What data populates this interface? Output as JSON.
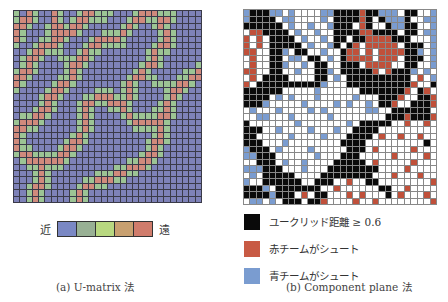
{
  "umatrix": {
    "caption": "(a) U-matrix 法",
    "scale": {
      "near_label": "近",
      "far_label": "遠",
      "colors": [
        "#7a88c4",
        "#98b094",
        "#b8d880",
        "#c8a070",
        "#d07c6c"
      ]
    },
    "cell_colors": {
      "b": "#7e82b8",
      "g": "#9cc494",
      "r": "#d08a7c",
      "y": "#b8cc8c"
    },
    "rows": [
      "gbrgbbrgbbgrrgggbbbgrrrgggbbbb",
      "grrgbbrgbgrrgggbbbgrrggrrgbbbb",
      "rrgbbgrrgrrgbbbbbgrgbbgrgbbbbb",
      "rgbbbgrrrrgbbbgggrgbbbbgrgbbbb",
      "rgbbggrrgbbbgrrrrgbbbbbgrgbbbb",
      "gbbgrrrgbbbgrrggggbbbbgrrgbbbb",
      "bbgrrgggbbgrggbbbbbbbgrggbbbbb",
      "bgrrgbbgggrrgbbbbbbbbgrgbbbbbb",
      "bgrgbbbbgrrgbbbbbbbbgrrgbbbbbg",
      "grrgbbbbgrgbbbbbbbbgrgbbbbbggr",
      "rrgbbbbggrgbbbbbbbgrrggbbbggrr",
      "rgbbbbgrrgbbbbbbbgrgbbggggrrgb",
      "gbbbbgrrgbbbbgggbgrgbbbbgrrgbb",
      "bbbbgrrgbbbggrrrggrgbbbbgrgbbb",
      "bbbbgrgbbbgrrggrrrgbbbbgrgbbbb",
      "bbbgrrgbbbgrgbbggrgbbbggrgbbbb",
      "bggrrgbbbbgrgbbbbgrggggrrgbbbb",
      "grrrgbbbbbgrgbbbbbgrrrrrgbbbbb",
      "rrggbbbbbbgrgbbbbbbggggrgbbbbb",
      "rgbbbbbbbgrgbbbbbbbbbbgrgbbbbb",
      "rgbbbbbbgrrgbbbbbbbbbgrrgbbbbb",
      "rggbbbbgrrgbbbbbbbbbbgrgbbbbbb",
      "grrggggrrgbbbbbbbbbbgrrgbbbbbb",
      "bgrrrrrrgbbbbbbbbbggrrgbbbbbbb",
      "bbggrgggbbbbbbbbggrrrgbbbbbbbb",
      "bbbgrgbbbbbbbgggrrggbbbbbbbbbb",
      "bbbgrgbbbbbggrrrggbbbbbbbbbbbb",
      "bbgrrgbbbbgrrggbbbbbbbbbbbbbbb",
      "bbgrgbbbbgrgbbbbbbbbbbbbbbbbbb",
      "bbgrgbbbbgrgbbbbbbbbbbbbbbbbbb"
    ]
  },
  "component_plane": {
    "caption": "(b) Component plane 法",
    "cell_colors": {
      "K": "#0a0a0a",
      "W": "#ffffff",
      "R": "#c0503a",
      "B": "#7a9cd0"
    },
    "legend": [
      {
        "label": "ユークリッド距離 ≥ 0.6",
        "color": "#0a0a0a"
      },
      {
        "label": "赤チームがシュート",
        "color": "#c85a44"
      },
      {
        "label": "青チームがシュート",
        "color": "#7a9cd0"
      }
    ],
    "rows": [
      "BKKKBBWBWWWWBBKKKKRKKBBBWKKWWB",
      "BKKKKWBBWWWWBWKKKKRKWKBBBKWWBB",
      "KKKKKKWBWWBWWBKKKWRKWWKBBKKWWB",
      "WRRKKKKWBWWBWWKKKKRRKKKKWKKWBB",
      "RWRWKKKKWBWWBWKKWKKRRRRKKKWWWB",
      "RWRWKKKKKWBWWBKWKRWRRRRRWKKKWB",
      "RRWWKKBWKKWWBWWKRRWRWRRRRKKBWB",
      "WRWWKKWBBWKKWBWKRRRRWRRRWKKKWB",
      "WRWWKKBWWBWKKWWKKKWRRRRWWKKWWB",
      "RRWWKKWWBWWKKBWKKKKKRWRKKKBWBW",
      "WRWKKKKWWWWKKWBWKKKKKKKKKKWRWB",
      "RWKKKKKKKKKKBWWWKKKKKKKKKKRWWK",
      "KKKKKKWWWWWBWWWWWWKKKKKKKRWKRW",
      "KKKKWBWBWWWBWWWWWBWWWKKKRWWKKR",
      "KKKBWWWWWBWWWWBWBWWBWKKRWWKKKR",
      "WBWWWBWWWWBWBWWWWWWBBWWKKKKKKW",
      "WWBBWWWBWWWWWBWWWWWWWWKKKRKKKR",
      "KWWWWWWWBWWWWWWWBWKKKKKWWRWWRW",
      "KKKWWBWWWWBWWWBWWKKKKWWWWWWWWW",
      "KKWWWWWBWWWWBWWWKKKKWRWWRWWRWW",
      "KKKWWWBWWWWWWWWKKKKWWWWWWWWWKW",
      "BKKKWBWWWWBWWWWWKKKWRWWWWWRWWW",
      "BBKKKWWWWWWBWWWKKKWWWWWRWWWWRW",
      "WWKKKWBWWBWWWWKKKKKWRWWWWWRWWW",
      "BBBKKKWWWBWWWKKKKKKKKWWWWRWWWW",
      "WBWKKKKKWWWWKKKKKKKKWWWRWWWRWW",
      "BWWKKKKKKWWKKKWWRWWKKWWWWWWWWR",
      "KKKBWKKKKKKKWWRWWWWWWKKWWRWWWW",
      "KKKKBKKKWRWKKWWWRWRWWWKWRWWWRW",
      "WBBWBWKKKWKKRWWWWRWWRWWWWWWWWR"
    ]
  }
}
